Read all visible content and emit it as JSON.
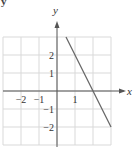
{
  "corner_mark": "y",
  "chart_data": {
    "type": "line",
    "title": "",
    "xlabel": "x",
    "ylabel": "y",
    "xlim": [
      -3,
      3
    ],
    "ylim": [
      -3,
      3
    ],
    "grid": true,
    "x_tick_labels": [
      {
        "value": -2,
        "label": "−2"
      },
      {
        "value": -1,
        "label": "−1"
      },
      {
        "value": 1,
        "label": "1"
      }
    ],
    "y_tick_labels": [
      {
        "value": 2,
        "label": "2"
      },
      {
        "value": 1,
        "label": "1"
      },
      {
        "value": -1,
        "label": "−1"
      },
      {
        "value": -2,
        "label": "−2"
      }
    ],
    "series": [
      {
        "name": "y = -2x + 4",
        "x": [
          0.5,
          3
        ],
        "y": [
          3,
          -2
        ],
        "color": "#666666"
      }
    ],
    "colors": {
      "grid": "#d9d9d9",
      "axis": "#555555",
      "line": "#666666",
      "text": "#333333"
    }
  }
}
